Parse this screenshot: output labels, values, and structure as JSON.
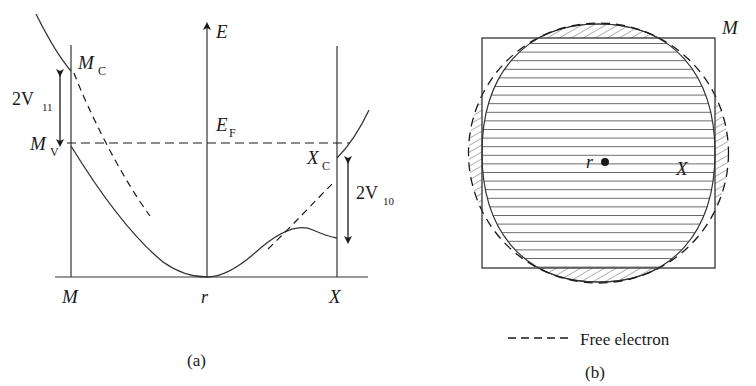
{
  "figure": {
    "type": "scientific-diagram",
    "panels": [
      {
        "id": "a",
        "caption": "(a)",
        "description": "Band energy dispersion along M - r - X with bonding and antibonding splittings",
        "axis": {
          "vertical_label": "E",
          "horizontal_ticks": [
            "M",
            "r",
            "X"
          ]
        },
        "labels": {
          "energy_axis": "E",
          "fermi_level": "E",
          "fermi_level_sub": "F",
          "mc": "M",
          "mc_sub": "C",
          "mv": "M",
          "mv_sub": "V",
          "xc": "X",
          "xc_sub": "C",
          "gap_left": "2V",
          "gap_left_sub": "11",
          "gap_right": "2V",
          "gap_right_sub": "10",
          "tick_m": "M",
          "tick_r": "r",
          "tick_x": "X"
        }
      },
      {
        "id": "b",
        "caption": "(b)",
        "description": "Brillouin zone square with hatched Fermi surface and dashed free-electron sphere",
        "labels": {
          "corner_m": "M",
          "edge_x": "X",
          "center_r": "r"
        },
        "legend": {
          "dashed_line_label": "Free electron"
        }
      }
    ]
  },
  "colors": {
    "ink": "#1a1a1a",
    "line": "#333333",
    "hatch": "#555555",
    "background": "#ffffff"
  }
}
